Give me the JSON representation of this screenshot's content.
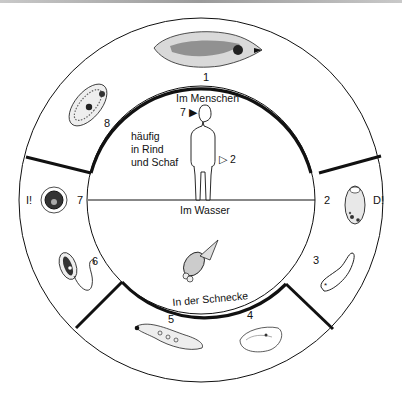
{
  "diagram": {
    "zones": {
      "human": "Im Menschen",
      "water": "Im Wasser",
      "snail": "In der Schnecke"
    },
    "host_note": [
      "häufig",
      "in Rind",
      "und Schaf"
    ],
    "human_markers": {
      "entry": "7 ▶",
      "exit": "▷ 2"
    },
    "stages": [
      {
        "number": "1",
        "name": "adult-fluke"
      },
      {
        "number": "2",
        "name": "egg",
        "mark": "D!"
      },
      {
        "number": "3",
        "name": "miracidium"
      },
      {
        "number": "4",
        "name": "sporocyst"
      },
      {
        "number": "5",
        "name": "redia"
      },
      {
        "number": "6",
        "name": "cercaria"
      },
      {
        "number": "7",
        "name": "metacercaria",
        "mark": "I!"
      },
      {
        "number": "8",
        "name": "juvenile-fluke"
      }
    ],
    "colors": {
      "line": "#111111",
      "background": "#ffffff",
      "fill_light": "#e6e6e6"
    }
  }
}
